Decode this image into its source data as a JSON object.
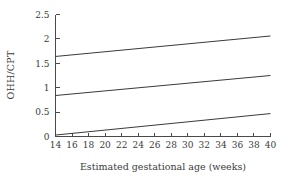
{
  "chart_data": {
    "type": "line",
    "title": "",
    "xlabel": "Estimated gestational age (weeks)",
    "ylabel": "OHH/CPT",
    "xlim": [
      14,
      40
    ],
    "ylim": [
      0,
      2.5
    ],
    "grid": false,
    "legend": "none",
    "x_ticks": [
      14,
      16,
      18,
      20,
      22,
      24,
      26,
      28,
      30,
      32,
      34,
      36,
      38,
      40
    ],
    "y_ticks": [
      0,
      0.5,
      1,
      1.5,
      2,
      2.5
    ],
    "x_tick_labels": [
      "14",
      "16",
      "18",
      "20",
      "22",
      "24",
      "26",
      "28",
      "30",
      "32",
      "34",
      "36",
      "38",
      "40"
    ],
    "y_tick_labels": [
      "0",
      "0.5",
      "1",
      "1.5",
      "2",
      "2.5"
    ],
    "x": [
      14,
      40
    ],
    "series": [
      {
        "name": "upper",
        "values": [
          1.64,
          2.06
        ]
      },
      {
        "name": "middle",
        "values": [
          0.84,
          1.25
        ]
      },
      {
        "name": "lower",
        "values": [
          0.03,
          0.47
        ]
      }
    ]
  },
  "labels": {
    "x_axis_title": "Estimated gestational age (weeks)",
    "y_axis_title": "OHH/CPT"
  },
  "colors": {
    "line": "#3a3a3a",
    "axis": "#4a4a4a",
    "text": "#3b3b3b",
    "background": "#ffffff"
  }
}
